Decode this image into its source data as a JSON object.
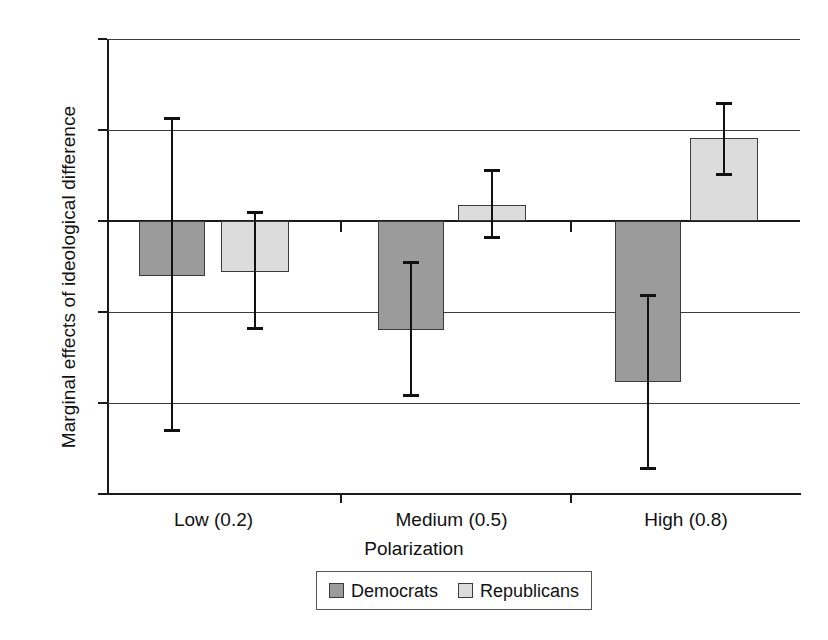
{
  "chart_data": {
    "type": "bar",
    "title": "",
    "xlabel": "Polarization",
    "ylabel": "Marginal effects of ideological difference",
    "categories": [
      "Low (0.2)",
      "Medium (0.5)",
      "High (0.8)"
    ],
    "ylim": [
      -1.5,
      1
    ],
    "yticks": [
      1,
      0.5,
      0,
      -0.5,
      -1,
      -1.5
    ],
    "ytick_labels": [
      "1",
      "0.5",
      "0",
      "−0.5",
      "−1",
      "−1.5"
    ],
    "grid": true,
    "legend_position": "bottom-center",
    "series": [
      {
        "name": "Democrats",
        "color": "#9b9b9b",
        "values": [
          -0.3,
          -0.6,
          -0.885
        ],
        "err_low": [
          -1.16,
          -0.965,
          -1.37
        ],
        "err_high": [
          0.57,
          -0.22,
          -0.4
        ]
      },
      {
        "name": "Republicans",
        "color": "#dcdcdc",
        "values": [
          -0.28,
          0.088,
          0.455
        ],
        "err_low": [
          -0.6,
          -0.1,
          0.245
        ],
        "err_high": [
          0.055,
          0.285,
          0.655
        ]
      }
    ]
  },
  "legend": {
    "entries": [
      {
        "label": "Democrats"
      },
      {
        "label": "Republicans"
      }
    ]
  }
}
